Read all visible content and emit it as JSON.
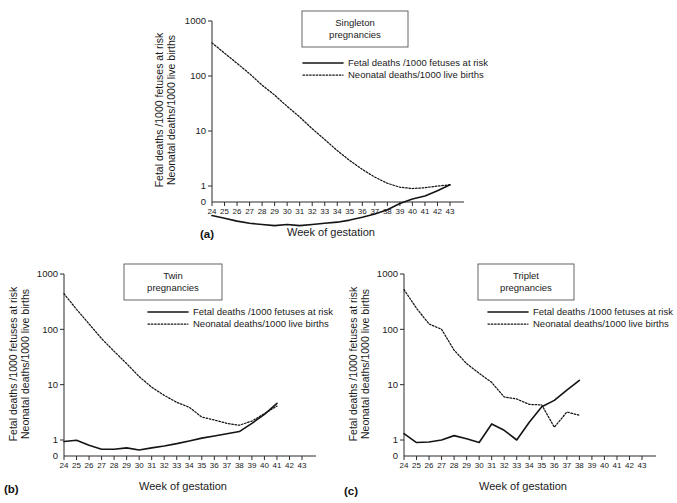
{
  "figure": {
    "y_axis_title_line1": "Fetal deaths /1000 fetuses at risk",
    "y_axis_title_line2": "Neonatal deaths/1000 live births",
    "x_axis_title": "Week of gestation",
    "y_ticks": [
      "1000",
      "100",
      "10",
      "1",
      "0"
    ],
    "x_ticks": [
      "24",
      "25",
      "26",
      "27",
      "28",
      "29",
      "30",
      "31",
      "32",
      "33",
      "34",
      "35",
      "36",
      "37",
      "38",
      "39",
      "40",
      "41",
      "42",
      "43"
    ],
    "legend": {
      "solid": "Fetal deaths /1000 fetuses at risk",
      "dotted": "Neonatal deaths/1000 live births"
    },
    "line_color": "#141414"
  },
  "panels": [
    {
      "key": "a",
      "label": "(a)",
      "title_line1": "Singleton",
      "title_line2": "pregnancies"
    },
    {
      "key": "b",
      "label": "(b)",
      "title_line1": "Twin",
      "title_line2": "pregnancies"
    },
    {
      "key": "c",
      "label": "(c)",
      "title_line1": "Triplet",
      "title_line2": "pregnancies"
    }
  ],
  "chart_data": [
    {
      "type": "line",
      "title": "Singleton pregnancies",
      "xlabel": "Week of gestation",
      "ylabel": "Fetal deaths /1000 fetuses at risk / Neonatal deaths/1000 live births",
      "yscale": "log",
      "ylim": [
        0.2,
        1000
      ],
      "yticks": [
        1,
        10,
        100,
        1000
      ],
      "x": [
        24,
        25,
        26,
        27,
        28,
        29,
        30,
        31,
        32,
        33,
        34,
        35,
        36,
        37,
        38,
        39,
        40,
        41,
        42,
        43
      ],
      "grid": false,
      "legend_position": "top-right",
      "series": [
        {
          "name": "Fetal deaths /1000 fetuses at risk",
          "style": "solid",
          "x": [
            24,
            25,
            26,
            27,
            28,
            29,
            30,
            31,
            32,
            33,
            34,
            35,
            36,
            37,
            38,
            39,
            40,
            41,
            42,
            43
          ],
          "values": [
            0.29,
            0.26,
            0.23,
            0.21,
            0.2,
            0.19,
            0.2,
            0.19,
            0.2,
            0.21,
            0.22,
            0.24,
            0.27,
            0.31,
            0.37,
            0.48,
            0.58,
            0.66,
            0.82,
            1.05
          ]
        },
        {
          "name": "Neonatal deaths/1000 live births",
          "style": "dotted",
          "x": [
            24,
            25,
            26,
            27,
            28,
            29,
            30,
            31,
            32,
            33,
            34,
            35,
            36,
            37,
            38,
            39,
            40,
            41,
            42,
            43
          ],
          "values": [
            400,
            260,
            170,
            110,
            68,
            45,
            28,
            18,
            11,
            7.0,
            4.4,
            2.9,
            2.0,
            1.45,
            1.12,
            0.95,
            0.9,
            0.93,
            1.0,
            1.05
          ]
        }
      ]
    },
    {
      "type": "line",
      "title": "Twin pregnancies",
      "xlabel": "Week of gestation",
      "ylabel": "Fetal deaths /1000 fetuses at risk / Neonatal deaths/1000 live births",
      "yscale": "log",
      "ylim": [
        0.2,
        1000
      ],
      "yticks": [
        1,
        10,
        100,
        1000
      ],
      "x": [
        24,
        25,
        26,
        27,
        28,
        29,
        30,
        31,
        32,
        33,
        34,
        35,
        36,
        37,
        38,
        39,
        40,
        41,
        42,
        43
      ],
      "grid": false,
      "legend_position": "top-right",
      "series": [
        {
          "name": "Fetal deaths /1000 fetuses at risk",
          "style": "solid",
          "x": [
            24,
            25,
            26,
            27,
            28,
            29,
            30,
            31,
            32,
            33,
            34,
            35,
            36,
            37,
            38,
            39,
            40,
            41
          ],
          "values": [
            0.94,
            0.99,
            0.8,
            0.68,
            0.68,
            0.72,
            0.66,
            0.72,
            0.78,
            0.86,
            0.96,
            1.08,
            1.18,
            1.3,
            1.42,
            2.0,
            2.9,
            4.6
          ]
        },
        {
          "name": "Neonatal deaths/1000 live births",
          "style": "dotted",
          "x": [
            24,
            25,
            26,
            27,
            28,
            29,
            30,
            31,
            32,
            33,
            34,
            35,
            36,
            37,
            38,
            39,
            40,
            41
          ],
          "values": [
            440,
            230,
            125,
            68,
            40,
            24,
            14,
            9.0,
            6.4,
            4.8,
            3.9,
            2.6,
            2.3,
            2.0,
            1.85,
            2.2,
            3.0,
            4.1
          ]
        }
      ]
    },
    {
      "type": "line",
      "title": "Triplet pregnancies",
      "xlabel": "Week of gestation",
      "ylabel": "Fetal deaths /1000 fetuses at risk / Neonatal deaths/1000 live births",
      "yscale": "log",
      "ylim": [
        0.2,
        1000
      ],
      "yticks": [
        1,
        10,
        100,
        1000
      ],
      "x": [
        24,
        25,
        26,
        27,
        28,
        29,
        30,
        31,
        32,
        33,
        34,
        35,
        36,
        37,
        38,
        39,
        40,
        41,
        42,
        43
      ],
      "grid": false,
      "legend_position": "top-right",
      "series": [
        {
          "name": "Fetal deaths /1000 fetuses at risk",
          "style": "solid",
          "x": [
            24,
            25,
            26,
            27,
            28,
            29,
            30,
            31,
            32,
            33,
            34,
            35,
            36,
            37,
            38
          ],
          "values": [
            1.3,
            0.9,
            0.92,
            1.0,
            1.2,
            1.05,
            0.9,
            1.95,
            1.5,
            1.0,
            2.1,
            4.0,
            5.2,
            8.0,
            12.0
          ]
        },
        {
          "name": "Neonatal deaths/1000 live births",
          "style": "dotted",
          "x": [
            24,
            25,
            26,
            27,
            28,
            29,
            30,
            31,
            32,
            33,
            34,
            35,
            36,
            37,
            38
          ],
          "values": [
            520,
            240,
            125,
            100,
            42,
            24,
            16,
            11,
            6.0,
            5.5,
            4.4,
            4.3,
            1.7,
            3.2,
            2.8
          ]
        }
      ]
    }
  ]
}
